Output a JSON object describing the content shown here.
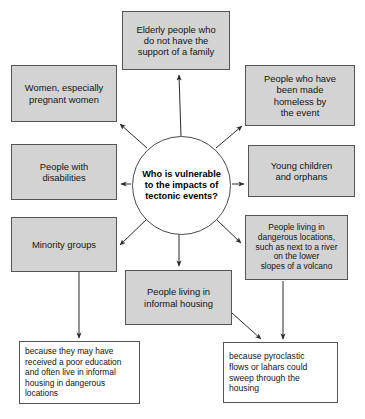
{
  "diagram": {
    "title": "Who is vulnerable to the impacts of tectonic events?",
    "center": {
      "label": "Who is vulnerable\nto the impacts of\ntectonic events?"
    },
    "colors": {
      "node_fill": "#d3d3d3",
      "node_border": "#555555",
      "white_fill": "#ffffff",
      "arrow": "#2b2b2b",
      "text": "#141414"
    },
    "nodes": [
      {
        "id": "elderly",
        "label": "Elderly people who\ndo not have the\nsupport of a family",
        "style": "gray",
        "x": 122,
        "y": 11,
        "w": 108,
        "h": 59,
        "font": 9.4
      },
      {
        "id": "women",
        "label": "Women, especially\npregnant women",
        "style": "gray",
        "x": 11,
        "y": 65,
        "w": 106,
        "h": 57,
        "font": 9.4
      },
      {
        "id": "homeless",
        "label": "People who have\nbeen made\nhomeless by\nthe event",
        "style": "gray",
        "x": 245,
        "y": 65,
        "w": 110,
        "h": 61,
        "font": 9.4
      },
      {
        "id": "disabilities",
        "label": "People with\ndisabilities",
        "style": "gray",
        "x": 11,
        "y": 144,
        "w": 106,
        "h": 56,
        "font": 9.4
      },
      {
        "id": "children",
        "label": "Young children\nand orphans",
        "style": "gray",
        "x": 248,
        "y": 145,
        "w": 107,
        "h": 52,
        "font": 9.4
      },
      {
        "id": "minority",
        "label": "Minority groups",
        "style": "gray",
        "x": 11,
        "y": 217,
        "w": 106,
        "h": 55,
        "font": 9.4
      },
      {
        "id": "dangerous",
        "label": "People living in\ndangerous locations,\nsuch as next to a river\non the lower\nslopes of a volcano",
        "style": "gray",
        "x": 245,
        "y": 215,
        "w": 103,
        "h": 65,
        "font": 8.4
      },
      {
        "id": "informal",
        "label": "People living in\ninformal housing",
        "style": "gray",
        "x": 125,
        "y": 270,
        "w": 107,
        "h": 55,
        "font": 9.4
      },
      {
        "id": "because-education",
        "label": "because they may have\nreceived a poor education\nand often live in informal\nhousing in dangerous\nlocations",
        "style": "white",
        "x": 19,
        "y": 341,
        "w": 121,
        "h": 63,
        "font": 8.4
      },
      {
        "id": "because-pyroclastic",
        "label": "because pyroclastic\nflows or lahars could\nsweep through the\nhousing",
        "style": "white",
        "x": 223,
        "y": 342,
        "w": 115,
        "h": 61,
        "font": 8.6
      }
    ],
    "connections": [
      {
        "from": "center",
        "to": "elderly",
        "kind": "arrow"
      },
      {
        "from": "center",
        "to": "women",
        "kind": "arrow"
      },
      {
        "from": "center",
        "to": "homeless",
        "kind": "arrow"
      },
      {
        "from": "center",
        "to": "disabilities",
        "kind": "arrow"
      },
      {
        "from": "center",
        "to": "children",
        "kind": "arrow"
      },
      {
        "from": "center",
        "to": "minority",
        "kind": "arrow"
      },
      {
        "from": "center",
        "to": "dangerous",
        "kind": "arrow"
      },
      {
        "from": "center",
        "to": "informal",
        "kind": "arrow"
      },
      {
        "from": "minority",
        "to": "because-education",
        "kind": "arrow"
      },
      {
        "from": "informal",
        "to": "because-pyroclastic",
        "kind": "arrow"
      },
      {
        "from": "dangerous",
        "to": "because-pyroclastic",
        "kind": "arrow"
      }
    ]
  }
}
